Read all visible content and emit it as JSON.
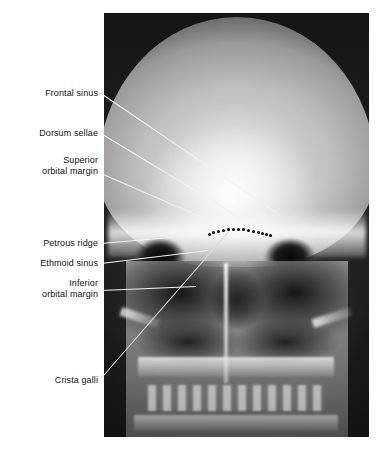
{
  "figure": {
    "type": "radiograph",
    "view": "skull-pa-caldwell",
    "background": "#ffffff",
    "panel": {
      "left": 104,
      "top": 13,
      "width": 265,
      "height": 424
    }
  },
  "labels": [
    {
      "id": "frontal-sinus",
      "text": "Frontal sinus",
      "x": 20,
      "y": 88,
      "width": 78
    },
    {
      "id": "dorsum-sellae",
      "text": "Dorsum sellae",
      "x": 13,
      "y": 128,
      "width": 85
    },
    {
      "id": "superior-orbital-margin",
      "text": "Superior\norbital margin",
      "x": 13,
      "y": 155,
      "width": 85
    },
    {
      "id": "petrous-ridge",
      "text": "Petrous ridge",
      "x": 18,
      "y": 238,
      "width": 80
    },
    {
      "id": "ethmoid-sinus",
      "text": "Ethmoid sinus",
      "x": 18,
      "y": 258,
      "width": 80
    },
    {
      "id": "inferior-orbital-margin",
      "text": "Inferior\norbital margin",
      "x": 13,
      "y": 278,
      "width": 85
    },
    {
      "id": "crista-galli",
      "text": "Crista galli",
      "x": 28,
      "y": 375,
      "width": 70
    }
  ],
  "leaders": [
    {
      "id": "leader-frontal-sinus",
      "x1": 101,
      "y1": 93,
      "x2": 276,
      "y2": 212,
      "color": "#f2f2f2"
    },
    {
      "id": "leader-dorsum-sellae",
      "x1": 101,
      "y1": 133,
      "x2": 243,
      "y2": 219,
      "color": "#f2f2f2"
    },
    {
      "id": "leader-superior-orbital-margin",
      "x1": 101,
      "y1": 173,
      "x2": 214,
      "y2": 222,
      "color": "#f2f2f2"
    },
    {
      "id": "leader-petrous-ridge",
      "x1": 101,
      "y1": 243,
      "x2": 205,
      "y2": 234,
      "color": "#f2f2f2"
    },
    {
      "id": "leader-ethmoid-sinus",
      "x1": 101,
      "y1": 263,
      "x2": 208,
      "y2": 250,
      "color": "#f2f2f2"
    },
    {
      "id": "leader-inferior-orbital-margin",
      "x1": 101,
      "y1": 290,
      "x2": 196,
      "y2": 286,
      "color": "#f2f2f2"
    },
    {
      "id": "leader-crista-galli",
      "x1": 101,
      "y1": 378,
      "x2": 229,
      "y2": 231,
      "color": "#dddddd"
    }
  ],
  "markers": {
    "petrous_ridge_dots": {
      "count": 14,
      "color": "#000000",
      "points": [
        [
          208,
          233
        ],
        [
          212,
          231
        ],
        [
          217,
          230
        ],
        [
          222,
          229
        ],
        [
          227,
          228
        ],
        [
          232,
          228
        ],
        [
          237,
          228
        ],
        [
          242,
          228
        ],
        [
          247,
          229
        ],
        [
          252,
          230
        ],
        [
          257,
          231
        ],
        [
          261,
          232
        ],
        [
          265,
          233
        ],
        [
          269,
          234
        ]
      ]
    }
  }
}
